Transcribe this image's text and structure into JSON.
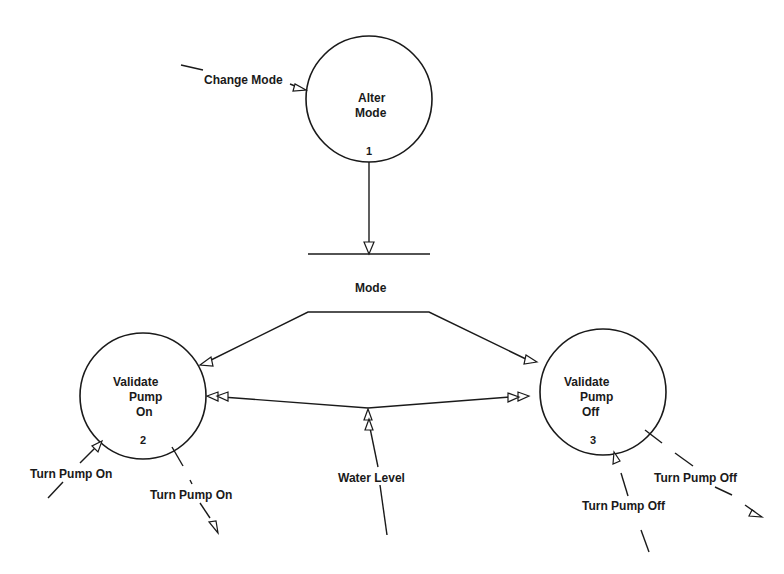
{
  "diagram": {
    "type": "data-flow-diagram",
    "processes": [
      {
        "id": "1",
        "line1": "Alter",
        "line2": "Mode",
        "line3": "",
        "number": "1"
      },
      {
        "id": "2",
        "line1": "Validate",
        "line2": "Pump",
        "line3": "On",
        "number": "2"
      },
      {
        "id": "3",
        "line1": "Validate",
        "line2": "Pump",
        "line3": "Off",
        "number": "3"
      }
    ],
    "data_store": {
      "label": "Mode"
    },
    "flows": {
      "change_mode": "Change Mode",
      "turn_pump_on_in": "Turn Pump On",
      "turn_pump_on_out": "Turn Pump On",
      "water_level": "Water Level",
      "turn_pump_off_in": "Turn Pump Off",
      "turn_pump_off_out": "Turn Pump Off"
    }
  }
}
